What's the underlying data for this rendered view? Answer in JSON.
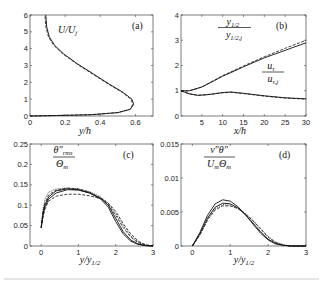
{
  "chart_data": [
    {
      "panel": "(a)",
      "type": "line",
      "title": "",
      "annotation": "U/U_j",
      "xlabel": "y/h",
      "ylabel": "",
      "xlim": [
        0,
        0.7
      ],
      "ylim": [
        0,
        6
      ],
      "xticks": [
        "0",
        "0.2",
        "0.4",
        "0.6"
      ],
      "yticks": [
        "0",
        "1",
        "2",
        "3",
        "4",
        "5",
        "6"
      ],
      "grid": false,
      "note": "Profile plotted with U/U_j on horizontal axis vs y/h on vertical axis",
      "series": [
        {
          "name": "solid",
          "style": "solid",
          "x": [
            0.0,
            0.15,
            0.35,
            0.5,
            0.57,
            0.59,
            0.58,
            0.53,
            0.45,
            0.36,
            0.27,
            0.19,
            0.14,
            0.11,
            0.095,
            0.09
          ],
          "y": [
            0.0,
            0.03,
            0.08,
            0.2,
            0.4,
            0.7,
            1.0,
            1.4,
            1.9,
            2.5,
            3.1,
            3.7,
            4.2,
            4.7,
            5.3,
            6.0
          ]
        },
        {
          "name": "dashed",
          "style": "dashed",
          "x": [
            0.0,
            0.15,
            0.35,
            0.5,
            0.57,
            0.585,
            0.575,
            0.525,
            0.445,
            0.355,
            0.265,
            0.185,
            0.135,
            0.105,
            0.09,
            0.085
          ],
          "y": [
            0.0,
            0.03,
            0.08,
            0.2,
            0.4,
            0.7,
            1.0,
            1.4,
            1.9,
            2.5,
            3.1,
            3.7,
            4.2,
            4.7,
            5.3,
            6.0
          ]
        }
      ]
    },
    {
      "panel": "(b)",
      "type": "line",
      "title": "",
      "xlabel": "x/h",
      "ylabel": "",
      "xlim": [
        0,
        30
      ],
      "ylim": [
        0,
        4
      ],
      "xticks": [
        "5",
        "10",
        "15",
        "20",
        "25",
        "30"
      ],
      "yticks": [
        "0",
        "1",
        "2",
        "3",
        "4"
      ],
      "grid": false,
      "annotations": [
        "y_1/2 / y_1/2,j",
        "u_tau / u_tau,j"
      ],
      "series": [
        {
          "name": "y1/2 / y1/2,j (solid)",
          "style": "solid",
          "x": [
            0,
            2,
            5,
            8,
            10,
            12,
            15,
            20,
            25,
            30
          ],
          "y": [
            1.0,
            1.0,
            1.15,
            1.4,
            1.58,
            1.72,
            1.95,
            2.3,
            2.6,
            2.9
          ]
        },
        {
          "name": "y1/2 / y1/2,j (dashed)",
          "style": "dashed",
          "x": [
            0,
            2,
            5,
            8,
            10,
            12,
            15,
            20,
            25,
            30
          ],
          "y": [
            1.0,
            1.0,
            1.15,
            1.42,
            1.6,
            1.75,
            1.98,
            2.35,
            2.68,
            3.0
          ]
        },
        {
          "name": "u_tau / u_tau,j (solid)",
          "style": "solid",
          "x": [
            0,
            2,
            4,
            6,
            8,
            10,
            12,
            15,
            20,
            25,
            30
          ],
          "y": [
            1.0,
            0.88,
            0.82,
            0.84,
            0.88,
            0.93,
            0.95,
            0.9,
            0.8,
            0.72,
            0.68
          ]
        },
        {
          "name": "u_tau / u_tau,j (dashed)",
          "style": "dashed",
          "x": [
            0,
            2,
            4,
            6,
            8,
            10,
            12,
            15,
            20,
            25,
            30
          ],
          "y": [
            1.0,
            0.88,
            0.82,
            0.84,
            0.88,
            0.92,
            0.94,
            0.89,
            0.79,
            0.71,
            0.67
          ]
        }
      ]
    },
    {
      "panel": "(c)",
      "type": "line",
      "title": "",
      "annotation": "theta''_rms / Theta_m",
      "xlabel": "y/y_1/2",
      "ylabel": "",
      "xlim": [
        -0.3,
        3
      ],
      "ylim": [
        0,
        0.25
      ],
      "xticks": [
        "0",
        "1",
        "2",
        "3"
      ],
      "yticks": [
        "0",
        "0.05",
        "0.1",
        "0.15",
        "0.2",
        "0.25"
      ],
      "grid": false,
      "series": [
        {
          "name": "solid 1",
          "style": "solid",
          "x": [
            0.0,
            0.05,
            0.1,
            0.2,
            0.4,
            0.7,
            1.0,
            1.3,
            1.6,
            1.8,
            2.0,
            2.2,
            2.4,
            2.6,
            2.8,
            3.0
          ],
          "y": [
            0.045,
            0.08,
            0.1,
            0.12,
            0.135,
            0.14,
            0.138,
            0.13,
            0.115,
            0.095,
            0.06,
            0.03,
            0.012,
            0.004,
            0.001,
            0.0
          ]
        },
        {
          "name": "solid 2",
          "style": "solid",
          "x": [
            0.0,
            0.05,
            0.1,
            0.2,
            0.4,
            0.7,
            1.0,
            1.3,
            1.6,
            1.8,
            2.0,
            2.2,
            2.4,
            2.6,
            2.8,
            3.0
          ],
          "y": [
            0.045,
            0.075,
            0.095,
            0.115,
            0.13,
            0.138,
            0.137,
            0.13,
            0.117,
            0.1,
            0.068,
            0.035,
            0.015,
            0.005,
            0.001,
            0.0
          ]
        },
        {
          "name": "dashed 1",
          "style": "dashed",
          "x": [
            0.0,
            0.05,
            0.1,
            0.2,
            0.4,
            0.7,
            1.0,
            1.3,
            1.6,
            1.8,
            2.0,
            2.2,
            2.4,
            2.6,
            2.8,
            3.0
          ],
          "y": [
            0.045,
            0.085,
            0.105,
            0.125,
            0.137,
            0.142,
            0.14,
            0.132,
            0.118,
            0.102,
            0.075,
            0.045,
            0.022,
            0.008,
            0.002,
            0.0
          ]
        },
        {
          "name": "dashed 2",
          "style": "dashed",
          "x": [
            0.0,
            0.05,
            0.1,
            0.2,
            0.4,
            0.7,
            1.0,
            1.3,
            1.6,
            1.8,
            2.0,
            2.2,
            2.4,
            2.6,
            2.8,
            3.0
          ],
          "y": [
            0.045,
            0.07,
            0.09,
            0.11,
            0.122,
            0.127,
            0.127,
            0.123,
            0.116,
            0.105,
            0.085,
            0.055,
            0.03,
            0.012,
            0.003,
            0.0
          ]
        },
        {
          "name": "dotted",
          "style": "dotted",
          "x": [
            0.0,
            0.05,
            0.1,
            0.2,
            0.4,
            0.7,
            1.0,
            1.3,
            1.6,
            1.8,
            2.0,
            2.2,
            2.4,
            2.6,
            2.8,
            3.0
          ],
          "y": [
            0.045,
            0.09,
            0.115,
            0.132,
            0.14,
            0.142,
            0.14,
            0.133,
            0.12,
            0.105,
            0.08,
            0.05,
            0.025,
            0.01,
            0.003,
            0.0
          ]
        }
      ]
    },
    {
      "panel": "(d)",
      "type": "line",
      "title": "",
      "annotation": "v''theta'' / (U_m Theta_m)",
      "xlabel": "y/y_1/2",
      "ylabel": "",
      "xlim": [
        -0.3,
        3
      ],
      "ylim": [
        0,
        0.015
      ],
      "xticks": [
        "0",
        "1",
        "2",
        "3"
      ],
      "yticks": [
        "0",
        "0.005",
        "0.01",
        "0.015"
      ],
      "grid": false,
      "series": [
        {
          "name": "solid 1",
          "style": "solid",
          "x": [
            0.0,
            0.2,
            0.4,
            0.6,
            0.8,
            1.0,
            1.2,
            1.4,
            1.6,
            1.8,
            2.0,
            2.2,
            2.4,
            2.6,
            3.0
          ],
          "y": [
            0.0,
            0.002,
            0.0045,
            0.0062,
            0.0068,
            0.0066,
            0.0058,
            0.0046,
            0.0032,
            0.0019,
            0.0009,
            0.0003,
            0.0001,
            0.0,
            0.0
          ]
        },
        {
          "name": "solid 2",
          "style": "solid",
          "x": [
            0.0,
            0.2,
            0.4,
            0.6,
            0.8,
            1.0,
            1.2,
            1.4,
            1.6,
            1.8,
            2.0,
            2.2,
            2.4,
            2.6,
            3.0
          ],
          "y": [
            0.0,
            0.0018,
            0.0041,
            0.0057,
            0.0063,
            0.0062,
            0.0056,
            0.0046,
            0.0034,
            0.0021,
            0.001,
            0.0004,
            0.0001,
            0.0,
            0.0
          ]
        },
        {
          "name": "dashed",
          "style": "dashed",
          "x": [
            0.0,
            0.2,
            0.4,
            0.6,
            0.8,
            1.0,
            1.2,
            1.4,
            1.6,
            1.8,
            2.0,
            2.2,
            2.4,
            2.6,
            3.0
          ],
          "y": [
            0.0,
            0.0016,
            0.0038,
            0.0053,
            0.0059,
            0.0059,
            0.0055,
            0.0047,
            0.0037,
            0.0025,
            0.0013,
            0.0005,
            0.0001,
            0.0,
            0.0
          ]
        },
        {
          "name": "dotted",
          "style": "dotted",
          "x": [
            0.0,
            0.2,
            0.4,
            0.6,
            0.8,
            1.0,
            1.2,
            1.4,
            1.6,
            1.8,
            2.0,
            2.2,
            2.4,
            2.6,
            3.0
          ],
          "y": [
            0.0,
            0.0017,
            0.0039,
            0.0055,
            0.0061,
            0.006,
            0.0056,
            0.0048,
            0.0038,
            0.0026,
            0.0014,
            0.0006,
            0.0002,
            0.0,
            0.0
          ]
        }
      ]
    }
  ],
  "labels": {
    "a_panel": "(a)",
    "a_annot": "U/U",
    "a_annot_sub": "j",
    "a_xlabel": "y/h",
    "b_panel": "(b)",
    "b_annot1_num": "y",
    "b_annot1_num_sub": "1/2",
    "b_annot1_den": "y",
    "b_annot1_den_sub": "1/2,j",
    "b_annot2_num": "u",
    "b_annot2_num_sub": "τ",
    "b_annot2_den": "u",
    "b_annot2_den_sub": "τ,j",
    "b_xlabel": "x/h",
    "c_panel": "(c)",
    "c_annot_num": "θ″",
    "c_annot_num_sub": "rms",
    "c_annot_den": "Θ",
    "c_annot_den_sub": "m",
    "c_xlabel": "y/y",
    "c_xlabel_sub": "1/2",
    "d_panel": "(d)",
    "d_annot_num": "v″θ″",
    "d_annot_den": "U",
    "d_annot_den_sub1": "m",
    "d_annot_den_mid": "Θ",
    "d_annot_den_sub2": "m",
    "d_xlabel": "y/y",
    "d_xlabel_sub": "1/2"
  }
}
